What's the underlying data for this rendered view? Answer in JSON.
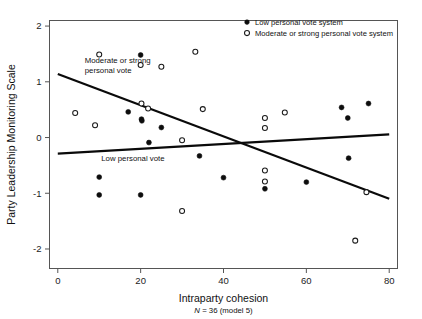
{
  "chart_data": {
    "type": "scatter",
    "title": "",
    "xlabel": "Intraparty cohesion",
    "xsublabel_italic": "N",
    "xsublabel_rest": " = 36 (model 5)",
    "ylabel": "Party Leadership Monitoring Scale",
    "xlim": [
      -2,
      82
    ],
    "ylim": [
      -2.35,
      2.1
    ],
    "xticks": [
      0,
      20,
      40,
      60,
      80
    ],
    "xticklabels": [
      "0",
      "20",
      "40",
      "60",
      "80"
    ],
    "yticks": [
      2,
      1,
      0,
      -1,
      -2
    ],
    "yticklabels": [
      "2",
      "1",
      "0",
      "-1",
      "-2"
    ],
    "grid": false,
    "legend_position": "top-right",
    "legend": [
      {
        "label": "Low personal vote system",
        "marker": "filled-circle"
      },
      {
        "label": "Moderate or strong personal vote system",
        "marker": "open-circle"
      }
    ],
    "annotations": [
      {
        "text": "Moderate or strong",
        "x": 6.5,
        "y": 1.345
      },
      {
        "text": "personal vote",
        "x": 6.5,
        "y": 1.165
      },
      {
        "text": "Low personal vote",
        "x": 10.5,
        "y": -0.43
      }
    ],
    "series": [
      {
        "name": "Low personal vote system",
        "marker": "filled-circle",
        "points": [
          {
            "x": 20.0,
            "y": 1.48
          },
          {
            "x": 17.0,
            "y": 0.46
          },
          {
            "x": 20.2,
            "y": 0.33
          },
          {
            "x": 20.3,
            "y": 0.3
          },
          {
            "x": 25.0,
            "y": 0.18
          },
          {
            "x": 22.0,
            "y": -0.09
          },
          {
            "x": 34.2,
            "y": -0.33
          },
          {
            "x": 40.0,
            "y": -0.72
          },
          {
            "x": 10.0,
            "y": -0.71
          },
          {
            "x": 10.0,
            "y": -1.03
          },
          {
            "x": 20.0,
            "y": -1.03
          },
          {
            "x": 50.0,
            "y": -0.92
          },
          {
            "x": 60.0,
            "y": -0.8
          },
          {
            "x": 68.5,
            "y": 0.54
          },
          {
            "x": 70.0,
            "y": 0.35
          },
          {
            "x": 75.0,
            "y": 0.61
          },
          {
            "x": 70.2,
            "y": -0.37
          }
        ]
      },
      {
        "name": "Moderate or strong personal vote system",
        "marker": "open-circle",
        "points": [
          {
            "x": 10.0,
            "y": 1.49
          },
          {
            "x": 20.0,
            "y": 1.3
          },
          {
            "x": 25.0,
            "y": 1.27
          },
          {
            "x": 33.2,
            "y": 1.54
          },
          {
            "x": 4.2,
            "y": 0.44
          },
          {
            "x": 9.0,
            "y": 0.22
          },
          {
            "x": 20.2,
            "y": 0.61
          },
          {
            "x": 21.8,
            "y": 0.52
          },
          {
            "x": 30.0,
            "y": -0.05
          },
          {
            "x": 35.0,
            "y": 0.51
          },
          {
            "x": 50.0,
            "y": 0.35
          },
          {
            "x": 50.0,
            "y": 0.17
          },
          {
            "x": 54.8,
            "y": 0.45
          },
          {
            "x": 50.0,
            "y": -0.59
          },
          {
            "x": 50.0,
            "y": -0.79
          },
          {
            "x": 30.0,
            "y": -1.32
          },
          {
            "x": 74.5,
            "y": -0.98
          },
          {
            "x": 71.8,
            "y": -1.85
          }
        ]
      }
    ],
    "fit_lines": [
      {
        "name": "Moderate or strong personal vote",
        "x0": 0.0,
        "y0": 1.14,
        "x1": 80.0,
        "y1": -1.1
      },
      {
        "name": "Low personal vote",
        "x0": 0.0,
        "y0": -0.29,
        "x1": 80.0,
        "y1": 0.055
      }
    ]
  }
}
